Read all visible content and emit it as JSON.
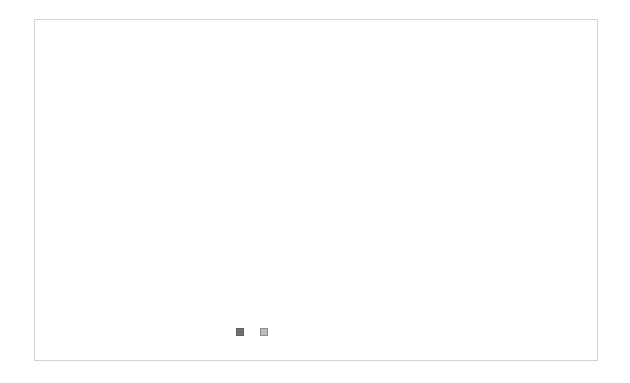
{
  "chart_data": {
    "type": "bar",
    "stacked": "percent",
    "title": "",
    "xlabel": "",
    "ylabel": "",
    "categories": [
      "smork",
      "used to smork",
      "never smork"
    ],
    "series": [
      {
        "name": "non-stroke",
        "values": [
          344,
          78,
          78
        ],
        "color": "#707070"
      },
      {
        "name": "stroke",
        "values": [
          485,
          8,
          7
        ],
        "color": "#bdbdbd"
      }
    ],
    "percent_non_stroke": [
      41.5,
      90.7,
      91.8
    ],
    "y_ticks": [
      "0%",
      "10%",
      "20%",
      "30%",
      "40%",
      "50%",
      "60%",
      "70%",
      "80%",
      "90%",
      "100%"
    ],
    "ylim": [
      0,
      100
    ],
    "grid": true,
    "legend_position": "bottom"
  },
  "legend": {
    "items": [
      {
        "label": "non-stroke"
      },
      {
        "label": "stroke"
      }
    ]
  }
}
